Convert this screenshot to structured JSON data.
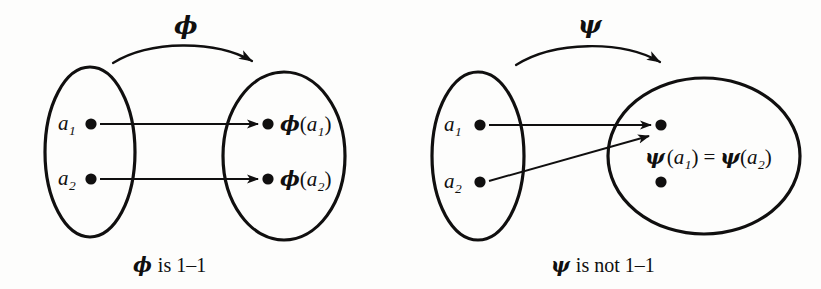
{
  "figure": {
    "background_color": "#fdfdfc",
    "ink_color": "#100f0f"
  },
  "panels": [
    {
      "id": "phi-panel",
      "map_symbol": "ϕ",
      "caption": "ϕ is 1–1",
      "caption_parts": {
        "symbol": "ϕ",
        "text": "is 1–1"
      },
      "domain": {
        "name": "domain-set",
        "shape": "ellipse",
        "elements": [
          {
            "label_base": "a",
            "label_sub": "1"
          },
          {
            "label_base": "a",
            "label_sub": "2"
          }
        ]
      },
      "codomain": {
        "name": "codomain-set",
        "shape": "ellipse",
        "elements": [
          {
            "symbol": "ϕ",
            "arg_base": "a",
            "arg_sub": "1"
          },
          {
            "symbol": "ϕ",
            "arg_base": "a",
            "arg_sub": "2"
          }
        ]
      },
      "mapping_arrows": 2,
      "is_one_to_one": true
    },
    {
      "id": "psi-panel",
      "map_symbol": "ψ",
      "caption": "ψ is not 1–1",
      "caption_parts": {
        "symbol": "ψ",
        "text": "is not 1–1"
      },
      "domain": {
        "name": "domain-set",
        "shape": "ellipse",
        "elements": [
          {
            "label_base": "a",
            "label_sub": "1"
          },
          {
            "label_base": "a",
            "label_sub": "2"
          }
        ]
      },
      "codomain": {
        "name": "codomain-set",
        "shape": "circle",
        "elements": [
          {
            "note": "shared-image-dot"
          },
          {
            "note": "unmapped-dot"
          }
        ],
        "equation": {
          "left_symbol": "ψ",
          "left_arg_base": "a",
          "left_arg_sub": "1",
          "relation": "=",
          "right_symbol": "ψ",
          "right_arg_base": "a",
          "right_arg_sub": "2"
        }
      },
      "mapping_arrows": 2,
      "is_one_to_one": false
    }
  ]
}
